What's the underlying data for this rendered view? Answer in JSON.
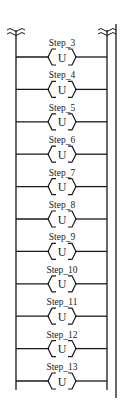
{
  "diagram": {
    "type": "ladder-logic",
    "colors": {
      "line": "#1a1a1a",
      "background": "#ffffff"
    },
    "break_symbol": "wavy-break",
    "rungs": [
      {
        "label": "Step_3",
        "coil": "U"
      },
      {
        "label": "Step_4",
        "coil": "U"
      },
      {
        "label": "Step_5",
        "coil": "U"
      },
      {
        "label": "Step_6",
        "coil": "U"
      },
      {
        "label": "Step_7",
        "coil": "U"
      },
      {
        "label": "Step_8",
        "coil": "U"
      },
      {
        "label": "Step_9",
        "coil": "U"
      },
      {
        "label": "Step_10",
        "coil": "U"
      },
      {
        "label": "Step_11",
        "coil": "U"
      },
      {
        "label": "Step_12",
        "coil": "U"
      },
      {
        "label": "Step_13",
        "coil": "U"
      }
    ]
  }
}
